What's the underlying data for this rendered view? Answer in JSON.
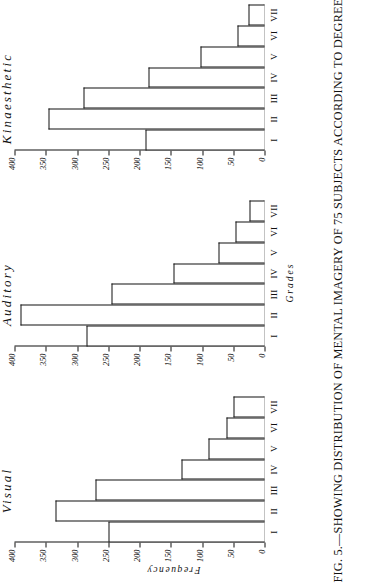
{
  "figure": {
    "caption_number": "FIG. 5.",
    "caption_dash": "—",
    "caption_text": "SHOWING DISTRIBUTION OF MENTAL IMAGERY OF 75 SUBJECTS ACCORDING TO DEGREE OF",
    "y_axis_label": "Frequency",
    "x_axis_label": "Grades"
  },
  "chart_data": [
    {
      "type": "bar",
      "title": "Visual",
      "xlabel": "Grades",
      "ylabel": "Frequency",
      "categories": [
        "I",
        "II",
        "III",
        "IV",
        "V",
        "VI",
        "VII"
      ],
      "values": [
        250,
        335,
        270,
        133,
        90,
        61,
        50
      ],
      "ylim": [
        0,
        400
      ],
      "yticks": [
        0,
        50,
        100,
        150,
        200,
        250,
        300,
        350,
        400
      ],
      "ytick_labels": [
        "0",
        "50",
        "100",
        "150",
        "200",
        "250",
        "300",
        "350",
        "400"
      ],
      "grid": false,
      "legend": "none",
      "orientation": "vertical"
    },
    {
      "type": "bar",
      "title": "Auditory",
      "xlabel": "Grades",
      "ylabel": "Frequency",
      "categories": [
        "I",
        "II",
        "III",
        "IV",
        "V",
        "VI",
        "VII"
      ],
      "values": [
        285,
        390,
        245,
        145,
        73,
        46,
        24
      ],
      "ylim": [
        0,
        400
      ],
      "yticks": [
        0,
        50,
        100,
        150,
        200,
        250,
        300,
        350,
        400
      ],
      "ytick_labels": [
        "0",
        "50",
        "100",
        "150",
        "200",
        "250",
        "300",
        "350",
        "400"
      ],
      "grid": false,
      "legend": "none",
      "orientation": "vertical"
    },
    {
      "type": "bar",
      "title": "Kinaesthetic",
      "xlabel": "Grades",
      "ylabel": "Frequency",
      "categories": [
        "I",
        "II",
        "III",
        "IV",
        "V",
        "VI",
        "VII"
      ],
      "values": [
        190,
        345,
        290,
        185,
        102,
        44,
        25
      ],
      "ylim": [
        0,
        400
      ],
      "yticks": [
        0,
        50,
        100,
        150,
        200,
        250,
        300,
        350,
        400
      ],
      "ytick_labels": [
        "0",
        "50",
        "100",
        "150",
        "200",
        "250",
        "300",
        "350",
        "400"
      ],
      "grid": false,
      "legend": "none",
      "orientation": "vertical"
    }
  ],
  "colors": {
    "ink": "#111111",
    "paper": "#ffffff"
  }
}
